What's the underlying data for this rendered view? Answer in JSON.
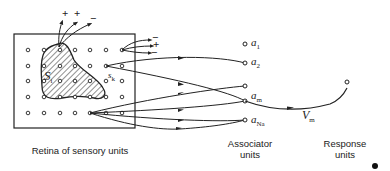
{
  "diagram": {
    "type": "perceptron",
    "retina": {
      "label": "Retina of sensory units",
      "stimulus_label": "S",
      "stimulus_sub": "i",
      "unit_label": "s",
      "unit_sub": "k",
      "signs_top": [
        "+",
        "+",
        "−"
      ],
      "signs_right": [
        "−",
        "+",
        "−"
      ]
    },
    "associators": {
      "label_line1": "Associator",
      "label_line2": "units",
      "units": [
        {
          "name": "a",
          "sub": "1"
        },
        {
          "name": "a",
          "sub": "2"
        },
        {
          "name": "a",
          "sub": "m"
        },
        {
          "name": "a",
          "sub": "Na"
        }
      ]
    },
    "response": {
      "label_line1": "Response",
      "label_line2": "units",
      "weight_label": "V",
      "weight_sub": "m"
    },
    "colors": {
      "ink": "#222222",
      "background": "#ffffff"
    }
  }
}
